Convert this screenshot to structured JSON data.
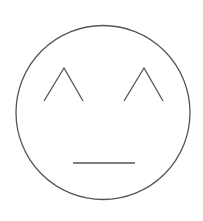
{
  "drawing": {
    "subject": "neutral face",
    "background_color": "#ffffff",
    "stroke_color": "#555555",
    "stroke_width": 1.3,
    "head": {
      "cx": 103,
      "cy": 112.5,
      "r": 87
    },
    "left_eye": {
      "points": "44,101 64,68 83,101"
    },
    "right_eye": {
      "points": "124,101 144,68 163,101"
    },
    "mouth": {
      "x1": 73,
      "y1": 163,
      "x2": 135,
      "y2": 163
    }
  }
}
